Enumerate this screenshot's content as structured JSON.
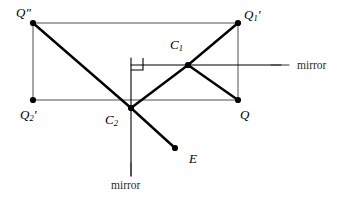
{
  "figure": {
    "type": "optics-ray-diagram",
    "background_color": "#ffffff",
    "ink_color": "#000000",
    "thin_line_color": "#3a3a3a"
  },
  "points": [
    {
      "id": "Qdd",
      "label": "Q",
      "prime": "″",
      "subscript": "",
      "x": 33,
      "y": 23,
      "label_x": 16,
      "label_y": 6,
      "dot": true
    },
    {
      "id": "Qp1",
      "label": "Q",
      "prime": "′",
      "subscript": "1",
      "x": 238,
      "y": 23,
      "label_x": 244,
      "label_y": 8,
      "dot": true
    },
    {
      "id": "Qp2",
      "label": "Q",
      "prime": "′",
      "subscript": "2",
      "x": 33,
      "y": 100,
      "label_x": 20,
      "label_y": 108,
      "dot": true
    },
    {
      "id": "Q",
      "label": "Q",
      "prime": "",
      "subscript": "",
      "x": 238,
      "y": 100,
      "label_x": 240,
      "label_y": 108,
      "dot": true
    },
    {
      "id": "C1",
      "label": "C",
      "prime": "",
      "subscript": "1",
      "x": 188,
      "y": 65,
      "label_x": 170,
      "label_y": 38,
      "dot": true
    },
    {
      "id": "C2",
      "label": "C",
      "prime": "",
      "subscript": "2",
      "x": 131,
      "y": 108,
      "label_x": 105,
      "label_y": 113,
      "dot": true
    },
    {
      "id": "E",
      "label": "E",
      "prime": "",
      "subscript": "",
      "x": 175,
      "y": 148,
      "label_x": 189,
      "label_y": 152,
      "dot": true
    }
  ],
  "thin_segments": [
    {
      "name": "rect-top",
      "x1": 33,
      "y1": 23,
      "x2": 238,
      "y2": 23
    },
    {
      "name": "rect-left",
      "x1": 33,
      "y1": 23,
      "x2": 33,
      "y2": 100
    },
    {
      "name": "rect-bottom",
      "x1": 33,
      "y1": 100,
      "x2": 238,
      "y2": 100
    },
    {
      "name": "rect-right",
      "x1": 238,
      "y1": 23,
      "x2": 238,
      "y2": 100
    }
  ],
  "mirror_lines": [
    {
      "name": "horizontal-mirror",
      "x1": 131,
      "y1": 65,
      "x2": 281,
      "y2": 65
    },
    {
      "name": "vertical-mirror",
      "x1": 131,
      "y1": 58,
      "x2": 131,
      "y2": 176
    }
  ],
  "ray_segments": [
    {
      "name": "ray-Qdd-C2",
      "x1": 33,
      "y1": 23,
      "x2": 131,
      "y2": 108
    },
    {
      "name": "ray-C2-C1",
      "x1": 131,
      "y1": 108,
      "x2": 188,
      "y2": 65
    },
    {
      "name": "ray-C1-Qp1",
      "x1": 188,
      "y1": 65,
      "x2": 238,
      "y2": 23
    },
    {
      "name": "ray-C1-Q",
      "x1": 188,
      "y1": 65,
      "x2": 238,
      "y2": 100
    },
    {
      "name": "ray-C2-E",
      "x1": 131,
      "y1": 108,
      "x2": 175,
      "y2": 148
    }
  ],
  "right_angle": {
    "name": "right-angle-mark",
    "x": 131,
    "y": 58,
    "size": 12
  },
  "mirror_labels": [
    {
      "id": "mirror-right",
      "text": "mirror",
      "x": 297,
      "y": 60,
      "tick": {
        "x1": 271,
        "y1": 65,
        "x2": 289,
        "y2": 65
      }
    },
    {
      "id": "mirror-bottom",
      "text": "mirror",
      "x": 111,
      "y": 180,
      "tick": {
        "x1": 131,
        "y1": 163,
        "x2": 131,
        "y2": 176
      }
    }
  ]
}
